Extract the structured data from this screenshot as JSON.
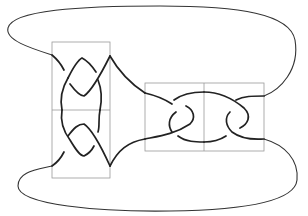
{
  "diagram": {
    "type": "knot-diagram",
    "colors": {
      "strand": "#222222",
      "box": "#9a9a9a",
      "background": "#ffffff"
    },
    "tangles": [
      {
        "id": "left-tangle",
        "orientation": "vertical",
        "cells": 2,
        "crossings_per_cell": 2
      },
      {
        "id": "right-tangle",
        "orientation": "horizontal",
        "cells": 2,
        "crossings_per_cell": 2
      }
    ],
    "outer_arcs": [
      "top-arc",
      "bottom-arc"
    ]
  }
}
